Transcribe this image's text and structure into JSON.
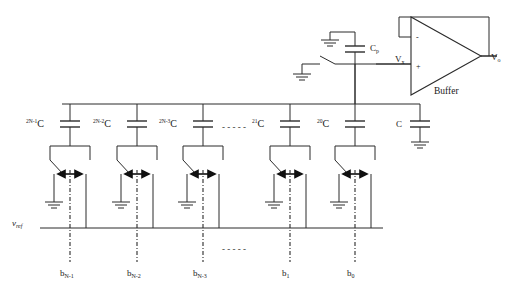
{
  "figure": {
    "kind": "circuit-schematic",
    "line_color": "#2b2b2b",
    "background": "#ffffff"
  },
  "buffer": {
    "label": "Buffer",
    "minus_sign": "-",
    "plus_sign": "+",
    "input_label": "V",
    "input_sub": "x",
    "output_label": "V",
    "output_sub": "o"
  },
  "parasitic": {
    "label": "C",
    "sub": "p"
  },
  "reference": {
    "label": "v",
    "sub": "ref"
  },
  "terminator": {
    "label": "C"
  },
  "ellipsis": {
    "top": "- - - - -",
    "bottom": "- - - - -"
  },
  "columns": [
    {
      "cap_base": "2",
      "cap_exp": "N-1",
      "cap_unit": "C",
      "bit_label": "b",
      "bit_sub": "N-1",
      "x": 70
    },
    {
      "cap_base": "2",
      "cap_exp": "N-2",
      "cap_unit": "C",
      "bit_label": "b",
      "bit_sub": "N-2",
      "x": 137
    },
    {
      "cap_base": "2",
      "cap_exp": "N-3",
      "cap_unit": "C",
      "bit_label": "b",
      "bit_sub": "N-3",
      "x": 203
    },
    {
      "cap_base": "2",
      "cap_exp": "1",
      "cap_unit": "C",
      "bit_label": "b",
      "bit_sub": "1",
      "x": 290
    },
    {
      "cap_base": "2",
      "cap_exp": "0",
      "cap_unit": "C",
      "bit_label": "b",
      "bit_sub": "0",
      "x": 355
    }
  ]
}
